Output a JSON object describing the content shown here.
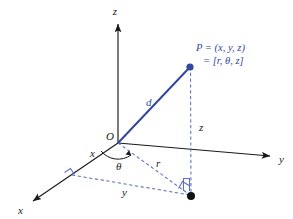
{
  "figure": {
    "title_text": "",
    "kind": "cylindrical-coordinates-3d-diagram",
    "colors": {
      "axis": "#1a1a1a",
      "blue": "#32479f",
      "dashed_blue": "#5a6fc4",
      "point_black": "#111111",
      "background": "#ffffff"
    },
    "axes": [
      {
        "name": "z-axis",
        "label": "z"
      },
      {
        "name": "y-axis",
        "label": "y"
      },
      {
        "name": "x-axis",
        "label": "x"
      }
    ],
    "labels": {
      "z_axis": "z",
      "y_axis": "y",
      "x_axis": "x",
      "x_projection": "x",
      "origin": "O",
      "theta": "θ",
      "r": "r",
      "d": "d",
      "z_height": "z",
      "y_projection": "y"
    },
    "point_label": {
      "line1": "P = (x, y, z)",
      "line2": "= [r, θ, z]"
    },
    "markers": {
      "point_p": "filled-blue-dot",
      "point_projection": "filled-black-dot",
      "right_angle_x": "right-angle-marker",
      "right_angle_xy": "right-angle-marker",
      "angle_arc": "theta-arc-with-arrow"
    }
  }
}
